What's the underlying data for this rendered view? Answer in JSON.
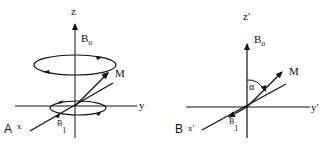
{
  "panels": [
    {
      "id": "A",
      "panel_label": "A",
      "axis_z": "z",
      "axis_y": "y",
      "axis_x": "x",
      "field_label": "B",
      "field_sub": "o",
      "rf_label": "B",
      "rf_sub": "1",
      "mag_label": "M"
    },
    {
      "id": "B",
      "panel_label": "B",
      "axis_z": "z′",
      "axis_y": "y′",
      "axis_x": "x′",
      "field_label": "B",
      "field_sub": "o",
      "rf_label": "B",
      "rf_sub": "1",
      "mag_label": "M",
      "angle_label": "α"
    }
  ],
  "colors": {
    "stroke": "#111111",
    "background": "#ffffff"
  }
}
